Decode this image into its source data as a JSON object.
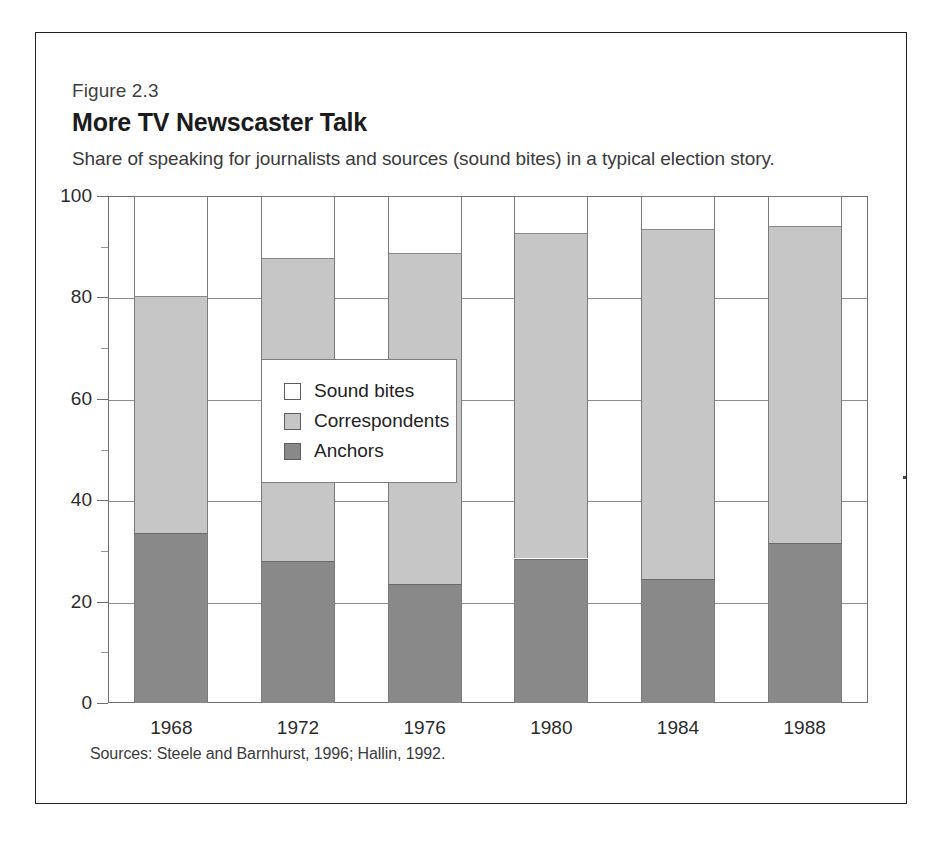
{
  "figure": {
    "number": "Figure 2.3",
    "title": "More TV Newscaster Talk",
    "subtitle": "Share of speaking for journalists and sources (sound bites) in a typical election story.",
    "source": "Sources: Steele and Barnhurst, 1996; Hallin, 1992."
  },
  "legend": {
    "position": "inside-center-left",
    "items": [
      {
        "label": "Sound bites",
        "color": "#ffffff"
      },
      {
        "label": "Correspondents",
        "color": "#c6c6c6"
      },
      {
        "label": "Anchors",
        "color": "#898989"
      }
    ]
  },
  "axis": {
    "y_ticks": [
      "0",
      "20",
      "40",
      "60",
      "80",
      "100"
    ],
    "y_minor_ticks": [
      10,
      30,
      50,
      70,
      90
    ],
    "x_ticks": [
      "1968",
      "1972",
      "1976",
      "1980",
      "1984",
      "1988"
    ]
  },
  "chart_data": {
    "type": "bar",
    "stacked": true,
    "title": "More TV Newscaster Talk",
    "subtitle": "Share of speaking for journalists and sources (sound bites) in a typical election story.",
    "xlabel": "",
    "ylabel": "",
    "ylim": [
      0,
      100
    ],
    "grid": true,
    "legend_position": "inside-center-left",
    "categories": [
      "1968",
      "1972",
      "1976",
      "1980",
      "1984",
      "1988"
    ],
    "series": [
      {
        "name": "Anchors",
        "color": "#898989",
        "values": [
          33.5,
          28.0,
          23.5,
          28.5,
          24.5,
          31.5
        ]
      },
      {
        "name": "Correspondents",
        "color": "#c6c6c6",
        "values": [
          46.8,
          59.8,
          65.3,
          64.2,
          69.0,
          62.5
        ]
      },
      {
        "name": "Sound bites",
        "color": "#ffffff",
        "values": [
          19.7,
          12.2,
          11.2,
          7.3,
          6.5,
          6.0
        ]
      }
    ],
    "cumulative_tops": {
      "anchors": [
        33.5,
        28.0,
        23.5,
        28.5,
        24.5,
        31.5
      ],
      "correspondents": [
        80.3,
        87.8,
        88.8,
        92.7,
        93.5,
        94.0
      ],
      "sound_bites": [
        100,
        100,
        100,
        100,
        100,
        100
      ]
    },
    "source": "Sources: Steele and Barnhurst, 1996; Hallin, 1992."
  }
}
